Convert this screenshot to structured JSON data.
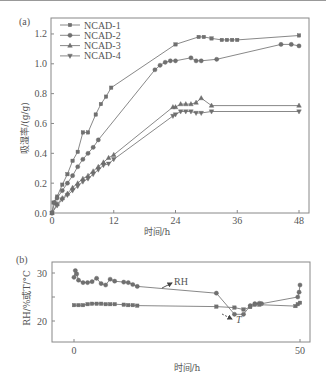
{
  "chart_data": [
    {
      "panel_label": "(a)",
      "type": "line",
      "xlabel": "时间/h",
      "ylabel": "吸湿率/(g/g)",
      "xlim": [
        0,
        50
      ],
      "ylim": [
        0,
        1.3
      ],
      "xticks": [
        0,
        12,
        24,
        36,
        48
      ],
      "yticks": [
        0.0,
        0.2,
        0.4,
        0.6,
        0.8,
        1.0,
        1.2
      ],
      "ytick_labels": [
        "0.0",
        "0.2",
        "0.4",
        "0.6",
        "0.8",
        "1.0",
        "1.2"
      ],
      "grid": false,
      "legend_position": "top-left",
      "series": [
        {
          "name": "NCAD-1",
          "marker": "square",
          "x": [
            0,
            0.3,
            1,
            2,
            3,
            4,
            5,
            6,
            7,
            8.5,
            9.5,
            10.5,
            11.5,
            24,
            28.5,
            29.5,
            31,
            33,
            34,
            35,
            36,
            48
          ],
          "y": [
            0.0,
            0.07,
            0.11,
            0.19,
            0.26,
            0.35,
            0.41,
            0.54,
            0.54,
            0.66,
            0.73,
            0.78,
            0.84,
            1.13,
            1.18,
            1.18,
            1.17,
            1.16,
            1.16,
            1.16,
            1.16,
            1.19
          ]
        },
        {
          "name": "NCAD-2",
          "marker": "circle",
          "x": [
            0,
            0.5,
            1,
            2,
            3,
            4,
            5,
            6,
            7,
            8,
            9,
            20,
            21,
            22,
            23,
            24,
            27,
            28,
            29,
            32,
            44.5,
            46.5,
            48
          ],
          "y": [
            0.0,
            0.07,
            0.1,
            0.15,
            0.2,
            0.25,
            0.31,
            0.36,
            0.4,
            0.44,
            0.49,
            0.96,
            0.99,
            1.01,
            1.02,
            1.02,
            1.04,
            1.02,
            1.02,
            1.03,
            1.13,
            1.13,
            1.12
          ]
        },
        {
          "name": "NCAD-3",
          "marker": "triangle-up",
          "x": [
            0,
            1,
            2,
            3,
            4,
            5,
            6,
            7,
            8,
            9,
            10,
            11,
            12,
            23.5,
            24,
            25,
            26,
            27,
            28,
            29,
            31,
            48
          ],
          "y": [
            0.0,
            0.06,
            0.1,
            0.13,
            0.17,
            0.2,
            0.23,
            0.25,
            0.28,
            0.31,
            0.34,
            0.37,
            0.39,
            0.71,
            0.71,
            0.73,
            0.73,
            0.73,
            0.74,
            0.77,
            0.72,
            0.72
          ]
        },
        {
          "name": "NCAD-4",
          "marker": "triangle-down",
          "x": [
            0,
            1,
            2,
            3,
            4,
            5,
            6,
            7,
            8,
            9,
            10,
            11,
            12,
            23.5,
            24,
            25,
            26,
            27,
            28,
            29,
            31,
            48
          ],
          "y": [
            0.0,
            0.05,
            0.09,
            0.12,
            0.15,
            0.18,
            0.21,
            0.23,
            0.26,
            0.29,
            0.32,
            0.33,
            0.36,
            0.65,
            0.66,
            0.68,
            0.68,
            0.68,
            0.67,
            0.67,
            0.68,
            0.68
          ]
        }
      ]
    },
    {
      "panel_label": "(b)",
      "type": "line",
      "xlabel": "时间/h",
      "ylabel": "RH/%或T/°C",
      "xlim": [
        -5,
        52
      ],
      "ylim": [
        15.5,
        32.3
      ],
      "xticks": [
        0,
        50
      ],
      "yticks": [
        20,
        25,
        30
      ],
      "ytick_labels": [
        "20",
        "",
        "30"
      ],
      "grid": false,
      "annotations": [
        {
          "text": "RH",
          "target_series": "RH"
        },
        {
          "text": "T",
          "target_series": "T",
          "italic": true
        }
      ],
      "series": [
        {
          "name": "RH",
          "marker": "circle",
          "x": [
            0,
            0.3,
            0.6,
            1,
            2,
            3,
            4,
            5,
            6,
            7,
            8,
            9,
            11,
            12,
            13,
            14,
            31.5,
            35.5,
            37.5,
            39,
            40,
            41,
            41.5,
            49.5,
            49.8,
            50
          ],
          "y": [
            29.1,
            30.5,
            29.8,
            28.5,
            28.0,
            28.0,
            28.2,
            28.9,
            27.8,
            27.5,
            28.7,
            28.3,
            28.1,
            28.0,
            27.6,
            27.2,
            25.8,
            21.4,
            21.4,
            23.2,
            23.6,
            23.7,
            23.6,
            25.0,
            26.0,
            27.5
          ]
        },
        {
          "name": "T",
          "marker": "square",
          "x": [
            0,
            1,
            2,
            3,
            4,
            5,
            6,
            7,
            8,
            9,
            11,
            12,
            13,
            14,
            31.5,
            35.5,
            37.5,
            39,
            40,
            41,
            49,
            49.5,
            50
          ],
          "y": [
            23.3,
            23.3,
            23.3,
            23.5,
            23.6,
            23.6,
            23.6,
            23.5,
            23.5,
            23.5,
            23.4,
            23.3,
            23.3,
            23.2,
            23.0,
            22.8,
            22.4,
            22.9,
            23.4,
            23.4,
            23.1,
            23.5,
            23.8
          ]
        }
      ]
    }
  ]
}
